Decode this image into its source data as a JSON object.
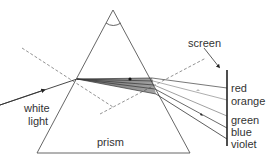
{
  "diagram": {
    "labels": {
      "white_light_line1": "white",
      "white_light_line2": "light",
      "prism": "prism",
      "screen": "screen"
    },
    "spectrum": [
      {
        "name": "red",
        "label": "red"
      },
      {
        "name": "orange",
        "label": "orange"
      },
      {
        "name": "green",
        "label": "green"
      },
      {
        "name": "blue",
        "label": "blue"
      },
      {
        "name": "violet",
        "label": "violet"
      }
    ],
    "colors": {
      "line": "#555555",
      "ray": "#333333",
      "dashed": "#777777",
      "screen": "#222222",
      "text": "#333333",
      "background": "#ffffff"
    }
  }
}
